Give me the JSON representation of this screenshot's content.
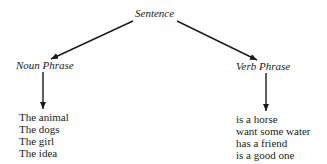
{
  "diagram": {
    "root": {
      "label": "Sentence"
    },
    "children": [
      {
        "label": "Noun Phrase",
        "examples": [
          "The animal",
          "The dogs",
          "The girl",
          "The idea"
        ]
      },
      {
        "label": "Verb Phrase",
        "examples": [
          "is a horse",
          "want some water",
          "has a friend",
          "is a good one"
        ]
      }
    ],
    "colors": {
      "line": "#1a1a1a",
      "text": "#1a1a1a",
      "background": "#ffffff"
    }
  }
}
